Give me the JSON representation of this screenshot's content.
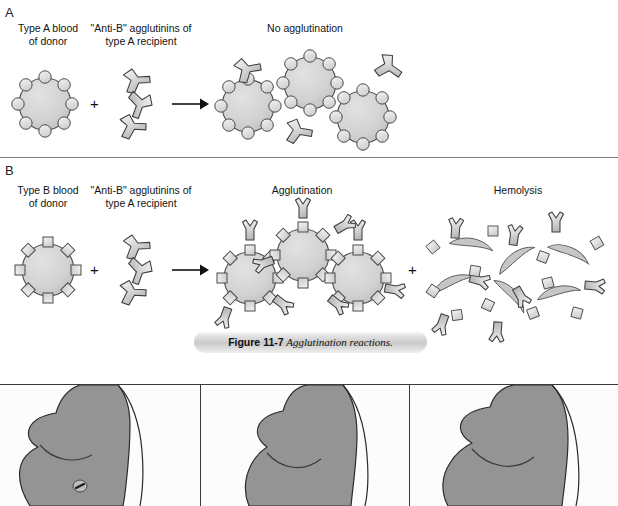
{
  "figure": {
    "caption_number": "Figure 11-7",
    "caption_title": "Agglutination reactions.",
    "panels": [
      {
        "letter": "A",
        "columns": [
          {
            "label": "Type A blood\nof donor"
          },
          {
            "label": "\"Anti-B\" agglutinins of\ntype A recipient"
          },
          {
            "label": "No agglutination"
          }
        ],
        "operator_plus": "+",
        "operator_arrow": "arrow-right-icon"
      },
      {
        "letter": "B",
        "columns": [
          {
            "label": "Type B blood\nof donor"
          },
          {
            "label": "\"Anti-B\" agglutinins of\ntype A recipient"
          },
          {
            "label": "Agglutination"
          },
          {
            "label": "Hemolysis"
          }
        ],
        "operator_plus": "+",
        "operator_plus_2": "+",
        "operator_arrow": "arrow-right-icon"
      }
    ]
  },
  "bottom_figure": {
    "panel_count": 3,
    "panels": [
      {
        "name": "torso-panel-1",
        "has_nipple_marker": true
      },
      {
        "name": "torso-panel-2",
        "has_nipple_marker": false
      },
      {
        "name": "torso-panel-3",
        "has_nipple_marker": false
      }
    ]
  },
  "colors": {
    "cell_fill": "#d4d4d4",
    "cell_stroke": "#4a4a4a",
    "antibody_fill": "#dcdcdc",
    "antibody_stroke": "#3c3c3c",
    "torso_fill": "#949494",
    "torso_stroke": "#2b2b2b",
    "rule": "#808080",
    "caption_band": "#c9c9c9",
    "text": "#141414"
  }
}
